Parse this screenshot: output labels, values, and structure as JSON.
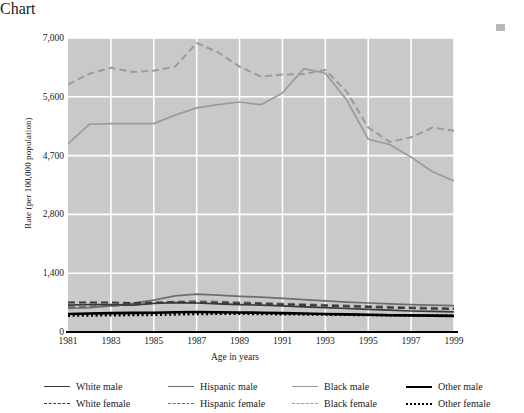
{
  "chart_data": {
    "type": "line",
    "title": "",
    "xlabel": "Age in years",
    "ylabel": "Rate (per 100,000 population)",
    "x": [
      1981,
      1982,
      1983,
      1984,
      1985,
      1986,
      1987,
      1988,
      1989,
      1990,
      1991,
      1992,
      1993,
      1994,
      1995,
      1996,
      1997,
      1998,
      1999
    ],
    "xticks": [
      "1981",
      "1983",
      "1985",
      "1987",
      "1989",
      "1991",
      "1993",
      "1995",
      "1997",
      "1999"
    ],
    "yticks": [
      "0",
      "1,400",
      "2,800",
      "4,700",
      "5,600",
      "7,000"
    ],
    "ytick_values": [
      0,
      1400,
      2800,
      4700,
      5600,
      7000
    ],
    "ylim": [
      0,
      7000
    ],
    "xlim": [
      1981,
      1999
    ],
    "grid": true,
    "grid_color": "#ffffff",
    "plot_background": "#c9c9c9",
    "legend_position": "bottom",
    "series": [
      {
        "name": "White male",
        "style": "solid",
        "color": "#3a3a3a",
        "values": [
          640,
          655,
          650,
          640,
          680,
          700,
          690,
          670,
          650,
          640,
          620,
          600,
          580,
          560,
          540,
          520,
          500,
          490,
          480
        ]
      },
      {
        "name": "White female",
        "style": "dashed",
        "color": "#3a3a3a",
        "values": [
          700,
          705,
          700,
          690,
          700,
          710,
          700,
          690,
          680,
          670,
          655,
          640,
          625,
          610,
          595,
          580,
          565,
          555,
          545
        ]
      },
      {
        "name": "Hispanic male",
        "style": "solid",
        "color": "#6e6e6e",
        "values": [
          560,
          580,
          620,
          680,
          760,
          860,
          900,
          880,
          850,
          830,
          800,
          770,
          740,
          710,
          690,
          670,
          650,
          640,
          630
        ]
      },
      {
        "name": "Hispanic female",
        "style": "dashed",
        "color": "#6e6e6e",
        "values": [
          590,
          600,
          620,
          650,
          690,
          720,
          730,
          720,
          705,
          690,
          675,
          660,
          645,
          630,
          615,
          600,
          585,
          575,
          565
        ]
      },
      {
        "name": "Black male",
        "style": "solid",
        "color": "#9b9b9b",
        "values": [
          4880,
          5180,
          5190,
          5190,
          5190,
          5320,
          5430,
          5480,
          5520,
          5480,
          5690,
          6270,
          6160,
          5550,
          4950,
          4870,
          4650,
          4180,
          3880
        ]
      },
      {
        "name": "Black female",
        "style": "dashed",
        "color": "#9b9b9b",
        "values": [
          5890,
          6150,
          6290,
          6190,
          6220,
          6320,
          6880,
          6660,
          6320,
          6080,
          6130,
          6140,
          6240,
          5720,
          5130,
          4910,
          4980,
          5130,
          5080
        ]
      },
      {
        "name": "Other male",
        "style": "solid-thick",
        "color": "#000000",
        "values": [
          430,
          440,
          450,
          455,
          460,
          470,
          475,
          470,
          465,
          460,
          450,
          440,
          430,
          420,
          410,
          400,
          395,
          390,
          385
        ]
      },
      {
        "name": "Other female",
        "style": "dotted",
        "color": "#000000",
        "values": [
          390,
          395,
          400,
          405,
          410,
          420,
          430,
          435,
          435,
          430,
          425,
          420,
          415,
          410,
          405,
          400,
          395,
          390,
          385
        ]
      }
    ]
  },
  "axes": {
    "y_title": "Rate (per 100,000 population)",
    "x_title": "Age in years"
  },
  "legend": {
    "columns": [
      {
        "entries": [
          {
            "label": "White male",
            "key": "k-solid-dk"
          },
          {
            "label": "White female",
            "key": "k-dash-dk"
          }
        ]
      },
      {
        "entries": [
          {
            "label": "Hispanic male",
            "key": "k-solid-md"
          },
          {
            "label": "Hispanic female",
            "key": "k-dash-md"
          }
        ]
      },
      {
        "entries": [
          {
            "label": "Black male",
            "key": "k-solid-lt"
          },
          {
            "label": "Black female",
            "key": "k-dash-lt"
          }
        ]
      },
      {
        "entries": [
          {
            "label": "Other male",
            "key": "k-solid-blk"
          },
          {
            "label": "Other female",
            "key": "k-dot-blk"
          }
        ]
      }
    ]
  }
}
